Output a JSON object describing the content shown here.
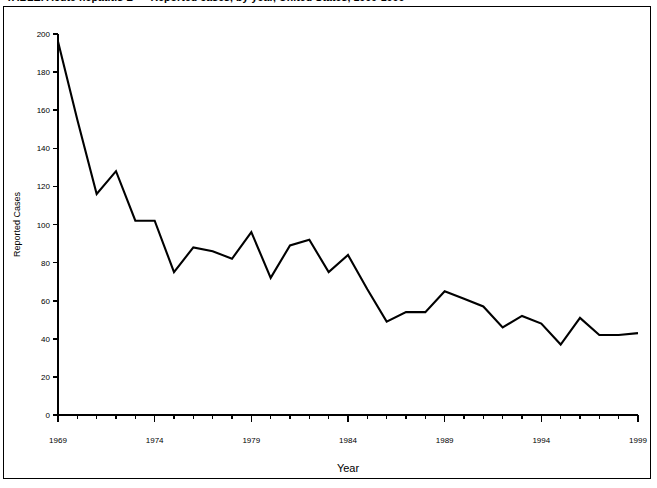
{
  "figure": {
    "title": "TABLE. Acute hepatitis B — Reported cases, by year, United States, 1969-1999"
  },
  "chart_data": {
    "type": "line",
    "title": "",
    "xlabel": "Year",
    "ylabel": "Reported Cases",
    "grid": false,
    "legend": "none",
    "xlim": [
      1969,
      1999
    ],
    "ylim": [
      0,
      200
    ],
    "y_ticks": [
      0,
      20,
      40,
      60,
      80,
      100,
      120,
      140,
      160,
      180,
      200
    ],
    "y_tick_labels": [
      "0",
      "20",
      "40",
      "60",
      "80",
      "100",
      "120",
      "140",
      "160",
      "180",
      "200"
    ],
    "x_ticks": [
      1969,
      1974,
      1979,
      1984,
      1989,
      1994,
      1999
    ],
    "x_tick_labels": [
      "1969",
      "1974",
      "1979",
      "1984",
      "1989",
      "1994",
      "1999"
    ],
    "x_minor_tick_step": 1,
    "series": [
      {
        "name": "Reported Cases",
        "color": "#000000",
        "x": [
          1969,
          1970,
          1971,
          1972,
          1973,
          1974,
          1975,
          1976,
          1977,
          1978,
          1979,
          1980,
          1981,
          1982,
          1983,
          1984,
          1985,
          1986,
          1987,
          1988,
          1989,
          1990,
          1991,
          1992,
          1993,
          1994,
          1995,
          1996,
          1997,
          1998,
          1999
        ],
        "values": [
          196,
          155,
          116,
          128,
          102,
          102,
          75,
          88,
          86,
          82,
          96,
          72,
          89,
          92,
          75,
          84,
          66,
          49,
          54,
          54,
          65,
          61,
          57,
          46,
          52,
          48,
          37,
          51,
          42,
          42,
          43
        ]
      }
    ]
  }
}
